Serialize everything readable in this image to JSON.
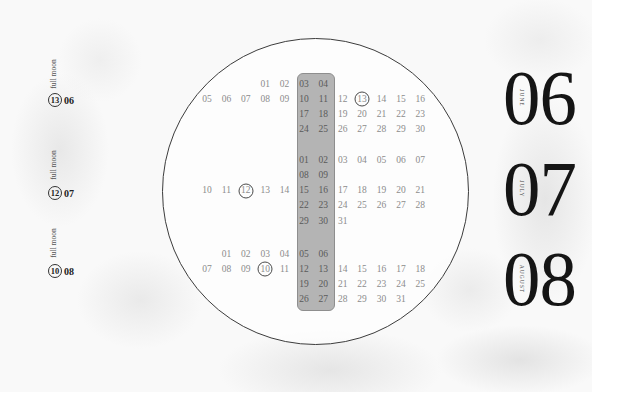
{
  "sidebar": {
    "full_moons": [
      {
        "label": "full moon",
        "day": "13",
        "month": "06"
      },
      {
        "label": "full moon",
        "day": "12",
        "month": "07"
      },
      {
        "label": "full moon",
        "day": "10",
        "month": "08"
      }
    ]
  },
  "calendar": {
    "highlight_columns": [
      5,
      6
    ],
    "months": [
      {
        "number": "06",
        "name": "JUNE",
        "full_moon_day": "13",
        "rows": [
          [
            "",
            "",
            "",
            "01",
            "02",
            "03",
            "04",
            "",
            "",
            "",
            "",
            ""
          ],
          [
            "05",
            "06",
            "07",
            "08",
            "09",
            "10",
            "11",
            "12",
            "13",
            "14",
            "15",
            "16"
          ],
          [
            "",
            "",
            "",
            "",
            "",
            "17",
            "18",
            "19",
            "20",
            "21",
            "22",
            "23"
          ],
          [
            "",
            "",
            "",
            "",
            "",
            "24",
            "25",
            "26",
            "27",
            "28",
            "29",
            "30"
          ]
        ]
      },
      {
        "number": "07",
        "name": "JULY",
        "full_moon_day": "12",
        "rows": [
          [
            "",
            "",
            "",
            "",
            "",
            "01",
            "02",
            "03",
            "04",
            "05",
            "06",
            "07"
          ],
          [
            "",
            "",
            "",
            "",
            "",
            "08",
            "09",
            "",
            "",
            "",
            "",
            ""
          ],
          [
            "10",
            "11",
            "12",
            "13",
            "14",
            "15",
            "16",
            "17",
            "18",
            "19",
            "20",
            "21"
          ],
          [
            "",
            "",
            "",
            "",
            "",
            "22",
            "23",
            "24",
            "25",
            "26",
            "27",
            "28"
          ],
          [
            "",
            "",
            "",
            "",
            "",
            "29",
            "30",
            "31",
            "",
            "",
            "",
            ""
          ]
        ]
      },
      {
        "number": "08",
        "name": "AUGUST",
        "full_moon_day": "10",
        "rows": [
          [
            "",
            "01",
            "02",
            "03",
            "04",
            "05",
            "06",
            "",
            "",
            "",
            "",
            ""
          ],
          [
            "07",
            "08",
            "09",
            "10",
            "11",
            "12",
            "13",
            "14",
            "15",
            "16",
            "17",
            "18"
          ],
          [
            "",
            "",
            "",
            "",
            "",
            "19",
            "20",
            "21",
            "22",
            "23",
            "24",
            "25"
          ],
          [
            "",
            "",
            "",
            "",
            "",
            "26",
            "27",
            "28",
            "29",
            "30",
            "31",
            ""
          ]
        ]
      }
    ]
  },
  "colors": {
    "band": "#b4b4b4",
    "ink": "#151515",
    "day_text": "#8c8c8c",
    "ring": "#3c3c3c"
  }
}
